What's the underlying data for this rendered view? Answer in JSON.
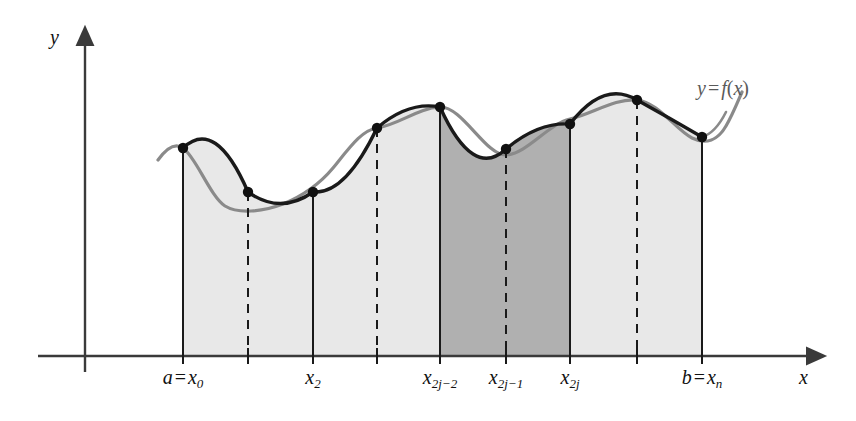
{
  "figure": {
    "axes": {
      "y_label": "y",
      "x_label": "x",
      "x_axis_y": 356,
      "y_axis_x": 85
    },
    "curve_label": {
      "y": "y",
      "equals": "=",
      "f": "f",
      "open": "(",
      "arg": "x",
      "close": ")"
    },
    "colors": {
      "light_fill": "#e8e8e8",
      "dark_fill": "#b0b0b0",
      "curve_gray": "#8a8a8a",
      "chord_dark": "#1a1a1a",
      "axis": "#3a3a3a",
      "background": "#ffffff"
    },
    "tick_labels": [
      {
        "name": "a-x0",
        "base": "a",
        "equals": "=",
        "var": "x",
        "sub": "0",
        "x": 183,
        "label_x": 183,
        "label_y": 366
      },
      {
        "name": "x2",
        "base": "",
        "equals": "",
        "var": "x",
        "sub": "2",
        "x": 313,
        "label_x": 313,
        "label_y": 366
      },
      {
        "name": "x2j-2",
        "base": "",
        "equals": "",
        "var": "x",
        "sub": "2j−2",
        "x": 440,
        "label_x": 440,
        "label_y": 366
      },
      {
        "name": "x2j-1",
        "base": "",
        "equals": "",
        "var": "x",
        "sub": "2j−1",
        "x": 506,
        "label_x": 506,
        "label_y": 366
      },
      {
        "name": "x2j",
        "base": "",
        "equals": "",
        "var": "x",
        "sub": "2j",
        "x": 570,
        "label_x": 570,
        "label_y": 366
      },
      {
        "name": "b-xn",
        "base": "b",
        "equals": "=",
        "var": "x",
        "sub": "n",
        "x": 702,
        "label_x": 702,
        "label_y": 366
      }
    ],
    "tick_marks_x": [
      183,
      248,
      313,
      377,
      440,
      506,
      570,
      637,
      702
    ]
  },
  "chart_data": {
    "type": "area",
    "xlabel": "x",
    "ylabel": "y",
    "grid": false,
    "legend": "none",
    "baseline_y_px": 356,
    "x_nodes_px": [
      183,
      248,
      313,
      377,
      440,
      506,
      570,
      637,
      702
    ],
    "y_nodes_px": [
      148,
      192,
      192,
      128,
      107,
      149,
      124,
      100,
      137
    ],
    "node_names": [
      "x0",
      "x1",
      "x2",
      "x2j-3",
      "x2j-2",
      "x2j-1",
      "x2j",
      "x2j+1",
      "xn"
    ],
    "solid_verticals_px": [
      183,
      313,
      440,
      570,
      702
    ],
    "dashed_verticals_px": [
      248,
      377,
      506,
      637
    ],
    "shaded_regions": [
      {
        "name": "light-left",
        "from_px": 183,
        "to_px": 440,
        "fill": "#e8e8e8"
      },
      {
        "name": "dark-middle",
        "from_px": 440,
        "to_px": 570,
        "fill": "#b0b0b0"
      },
      {
        "name": "light-right",
        "from_px": 570,
        "to_px": 702,
        "fill": "#e8e8e8"
      }
    ],
    "curve_extends_left_px": 158,
    "curve_extends_right_px": 742,
    "annotations": [
      {
        "text": "y = f(x)",
        "x_px": 700,
        "y_px": 88
      }
    ]
  }
}
